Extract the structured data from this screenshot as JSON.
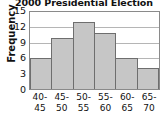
{
  "chart_data": {
    "type": "bar",
    "title": "2000 Presidential Election",
    "xlabel": "",
    "ylabel": "Frequency",
    "categories": [
      "40-\n45",
      "45-\n50",
      "50-\n55",
      "55-\n60",
      "60-\n65",
      "65-\n70"
    ],
    "category_lines": [
      [
        "40-",
        "45"
      ],
      [
        "45-",
        "50"
      ],
      [
        "50-",
        "55"
      ],
      [
        "55-",
        "60"
      ],
      [
        "60-",
        "65"
      ],
      [
        "65-",
        "70"
      ]
    ],
    "values": [
      6,
      10,
      13,
      11,
      6,
      4
    ],
    "ylim": [
      0,
      15
    ],
    "yticks": [
      15,
      12,
      9,
      6,
      3,
      0
    ],
    "grid": "horizontal",
    "legend": "none",
    "bar_fill_color": "#c6c6c6",
    "bar_border_color": "#6e6e6e",
    "gridline_color": "#b5b5b5",
    "axis_color": "#8a8a8a",
    "text_color": "#111111"
  }
}
